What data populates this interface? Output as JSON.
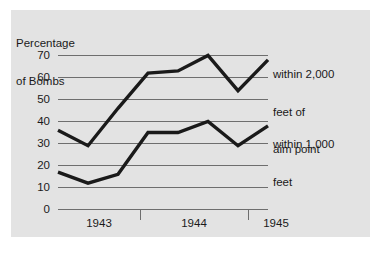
{
  "chart_data": {
    "type": "line",
    "title": "",
    "xlabel": "",
    "ylabel": "Percentage of Bombs",
    "ylabel_lines": [
      "Percentage",
      "of Bombs"
    ],
    "ylim": [
      0,
      70
    ],
    "yticks": [
      0,
      10,
      20,
      30,
      40,
      50,
      60,
      70
    ],
    "ytick_labels": [
      "0",
      "10",
      "20",
      "30",
      "40",
      "50",
      "60",
      "70"
    ],
    "xticks": [
      1943,
      1944,
      1945
    ],
    "xtick_labels": [
      "1943",
      "1944",
      "1945"
    ],
    "grid": true,
    "grid_axis": "y",
    "legend_position": "right-inline-annotations",
    "series": [
      {
        "name": "within 2,000 feet of aim point",
        "label_lines": [
          "within 2,000",
          "feet of",
          "aim point"
        ],
        "color": "#1a1a1a",
        "x": [
          0,
          1,
          2,
          3,
          4,
          5,
          6,
          7
        ],
        "values": [
          36,
          29,
          46,
          62,
          63,
          70,
          54,
          68
        ]
      },
      {
        "name": "within 1,000 feet",
        "label_lines": [
          "within 1,000",
          "feet"
        ],
        "color": "#1a1a1a",
        "x": [
          0,
          1,
          2,
          3,
          4,
          5,
          6,
          7
        ],
        "values": [
          17,
          12,
          16,
          35,
          35,
          40,
          29,
          38
        ]
      }
    ]
  },
  "colors": {
    "panel_background": "#e3e3e3",
    "page_background": "#ffffff",
    "line": "#1a1a1a",
    "gridline": "#6e6e6e",
    "text": "#1a1a1a"
  },
  "axis": {
    "y_title_line1": "Percentage",
    "y_title_line2": "of Bombs"
  },
  "yticks": {
    "t0": "0",
    "t1": "10",
    "t2": "20",
    "t3": "30",
    "t4": "40",
    "t5": "50",
    "t6": "60",
    "t7": "70"
  },
  "xticks": {
    "x0": "1943",
    "x1": "1944",
    "x2": "1945"
  },
  "annotations": {
    "upper": {
      "line1": "within 2,000",
      "line2": "feet of",
      "line3": "aim point"
    },
    "lower": {
      "line1": "within 1,000",
      "line2": "feet"
    }
  }
}
